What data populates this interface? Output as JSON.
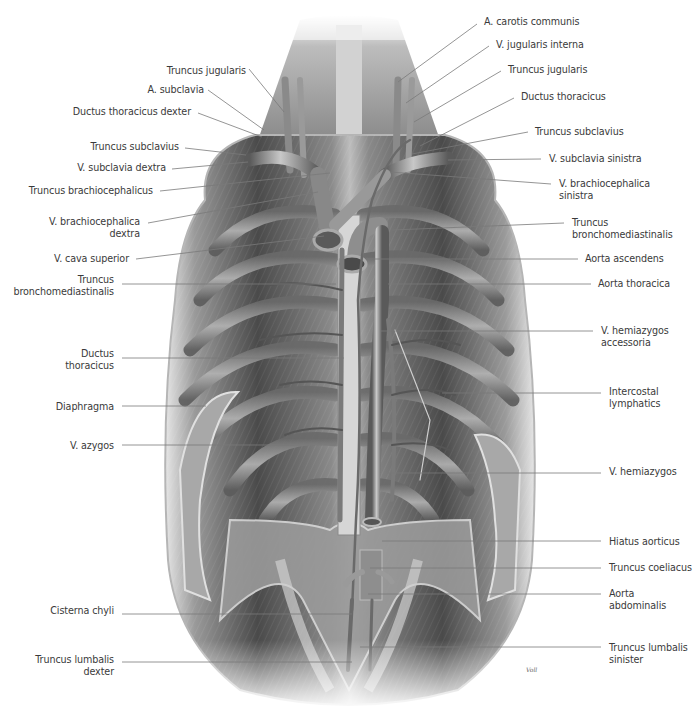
{
  "figure": {
    "colors": {
      "background": "#ffffff",
      "label_text": "#3a3a3a",
      "leader_line": "#7a7a7a",
      "muscle_dark": "#3c3c3c",
      "muscle_mid": "#7d7d7d",
      "muscle_light": "#c9c9c9",
      "vessel": "#8e8e8e",
      "vessel_highlight": "#d6d6d6"
    },
    "signature": "Voll"
  },
  "labels_left": [
    {
      "id": "truncus-jugularis-right",
      "lines": [
        "Truncus jugularis"
      ],
      "x_right": 246,
      "y": 65,
      "leader": [
        [
          249,
          69
        ],
        [
          284,
          112
        ]
      ]
    },
    {
      "id": "a-subclavia",
      "lines": [
        "A. subclavia"
      ],
      "x_right": 204,
      "y": 84,
      "leader": [
        [
          208,
          90
        ],
        [
          264,
          130
        ]
      ]
    },
    {
      "id": "ductus-thoracicus-dexter",
      "lines": [
        "Ductus thoracicus dexter"
      ],
      "x_right": 191,
      "y": 106,
      "leader": [
        [
          198,
          113
        ],
        [
          262,
          137
        ]
      ]
    },
    {
      "id": "truncus-subclavius-right",
      "lines": [
        "Truncus subclavius"
      ],
      "x_right": 179,
      "y": 141,
      "leader": [
        [
          185,
          148
        ],
        [
          246,
          155
        ]
      ]
    },
    {
      "id": "v-subclavia-dextra",
      "lines": [
        "V. subclavia dextra"
      ],
      "x_right": 166,
      "y": 162,
      "leader": [
        [
          172,
          169
        ],
        [
          248,
          162
        ]
      ]
    },
    {
      "id": "truncus-brachiocephalicus",
      "lines": [
        "Truncus brachiocephalicus"
      ],
      "x_right": 153,
      "y": 185,
      "leader": [
        [
          160,
          191
        ],
        [
          330,
          173
        ]
      ]
    },
    {
      "id": "v-brachiocephalica-dextra",
      "lines": [
        "V. brachiocephalica",
        "dextra"
      ],
      "x_right": 140,
      "y": 216,
      "leader": [
        [
          148,
          223
        ],
        [
          318,
          192
        ]
      ]
    },
    {
      "id": "v-cava-superior",
      "lines": [
        "V. cava superior"
      ],
      "x_right": 129,
      "y": 253,
      "leader": [
        [
          136,
          259
        ],
        [
          324,
          236
        ]
      ]
    },
    {
      "id": "truncus-bronchomediastinalis-right",
      "lines": [
        "Truncus",
        "bronchomediastinalis"
      ],
      "x_right": 114,
      "y": 274,
      "leader": [
        [
          122,
          284
        ],
        [
          336,
          284
        ]
      ]
    },
    {
      "id": "ductus-thoracicus-left-label",
      "lines": [
        "Ductus",
        "thoracicus"
      ],
      "x_right": 114,
      "y": 348,
      "leader": [
        [
          122,
          358
        ],
        [
          344,
          358
        ]
      ]
    },
    {
      "id": "diaphragma",
      "lines": [
        "Diaphragma"
      ],
      "x_right": 114,
      "y": 401,
      "leader": [
        [
          122,
          406
        ],
        [
          206,
          406
        ]
      ]
    },
    {
      "id": "v-azygos",
      "lines": [
        "V. azygos"
      ],
      "x_right": 114,
      "y": 440,
      "leader": [
        [
          122,
          445
        ],
        [
          336,
          445
        ]
      ]
    },
    {
      "id": "cisterna-chyli",
      "lines": [
        "Cisterna chyli"
      ],
      "x_right": 114,
      "y": 605,
      "leader": [
        [
          122,
          614
        ],
        [
          352,
          614
        ]
      ]
    },
    {
      "id": "truncus-lumbalis-dexter",
      "lines": [
        "Truncus lumbalis",
        "dexter"
      ],
      "x_right": 114,
      "y": 654,
      "leader": [
        [
          122,
          662
        ],
        [
          352,
          662
        ]
      ]
    }
  ],
  "labels_right": [
    {
      "id": "a-carotis-communis",
      "lines": [
        "A. carotis communis"
      ],
      "x_left": 484,
      "y": 16,
      "leader": [
        [
          477,
          24
        ],
        [
          398,
          82
        ]
      ]
    },
    {
      "id": "v-jugularis-interna",
      "lines": [
        "V. jugularis interna"
      ],
      "x_left": 496,
      "y": 39,
      "leader": [
        [
          489,
          46
        ],
        [
          406,
          103
        ]
      ]
    },
    {
      "id": "truncus-jugularis-left",
      "lines": [
        "Truncus jugularis"
      ],
      "x_left": 508,
      "y": 64,
      "leader": [
        [
          501,
          71
        ],
        [
          414,
          122
        ]
      ]
    },
    {
      "id": "ductus-thoracicus",
      "lines": [
        "Ductus thoracicus"
      ],
      "x_left": 521,
      "y": 91,
      "leader": [
        [
          514,
          98
        ],
        [
          420,
          146
        ]
      ]
    },
    {
      "id": "truncus-subclavius-left",
      "lines": [
        "Truncus subclavius"
      ],
      "x_left": 535,
      "y": 126,
      "leader": [
        [
          528,
          132
        ],
        [
          412,
          154
        ]
      ]
    },
    {
      "id": "v-subclavia-sinistra",
      "lines": [
        "V. subclavia sinistra"
      ],
      "x_left": 549,
      "y": 153,
      "leader": [
        [
          541,
          159
        ],
        [
          448,
          160
        ]
      ]
    },
    {
      "id": "v-brachiocephalica-sinistra",
      "lines": [
        "V. brachiocephalica",
        "sinistra"
      ],
      "x_left": 559,
      "y": 178,
      "leader": [
        [
          551,
          184
        ],
        [
          390,
          172
        ]
      ]
    },
    {
      "id": "truncus-bronchomediastinalis-left",
      "lines": [
        "Truncus",
        "bronchomediastinalis"
      ],
      "x_left": 572,
      "y": 217,
      "leader": [
        [
          564,
          223
        ],
        [
          392,
          230
        ]
      ]
    },
    {
      "id": "aorta-ascendens",
      "lines": [
        "Aorta ascendens"
      ],
      "x_left": 585,
      "y": 253,
      "leader": [
        [
          578,
          259
        ],
        [
          366,
          259
        ]
      ]
    },
    {
      "id": "aorta-thoracica",
      "lines": [
        "Aorta thoracica"
      ],
      "x_left": 598,
      "y": 278,
      "leader": [
        [
          591,
          284
        ],
        [
          388,
          284
        ]
      ]
    },
    {
      "id": "v-hemiazygos-accessoria",
      "lines": [
        "V. hemiazygos",
        "accessoria"
      ],
      "x_left": 601,
      "y": 325,
      "leader": [
        [
          593,
          331
        ],
        [
          380,
          331
        ]
      ]
    },
    {
      "id": "intercostal-lymphatics",
      "lines": [
        "Intercostal",
        "lymphatics"
      ],
      "x_left": 609,
      "y": 386,
      "leader": [
        [
          601,
          393
        ],
        [
          442,
          393
        ]
      ]
    },
    {
      "id": "v-hemiazygos",
      "lines": [
        "V. hemiazygos"
      ],
      "x_left": 609,
      "y": 466,
      "leader": [
        [
          601,
          473
        ],
        [
          388,
          473
        ]
      ]
    },
    {
      "id": "hiatus-aorticus",
      "lines": [
        "Hiatus aorticus"
      ],
      "x_left": 609,
      "y": 536,
      "leader": [
        [
          601,
          541
        ],
        [
          382,
          541
        ]
      ]
    },
    {
      "id": "truncus-coeliacus",
      "lines": [
        "Truncus coeliacus"
      ],
      "x_left": 609,
      "y": 562,
      "leader": [
        [
          601,
          568
        ],
        [
          370,
          568
        ]
      ]
    },
    {
      "id": "aorta-abdominalis",
      "lines": [
        "Aorta",
        "abdominalis"
      ],
      "x_left": 609,
      "y": 588,
      "leader": [
        [
          601,
          594
        ],
        [
          368,
          594
        ]
      ]
    },
    {
      "id": "truncus-lumbalis-sinister",
      "lines": [
        "Truncus lumbalis",
        "sinister"
      ],
      "x_left": 609,
      "y": 642,
      "leader": [
        [
          601,
          647
        ],
        [
          360,
          647
        ]
      ]
    }
  ]
}
